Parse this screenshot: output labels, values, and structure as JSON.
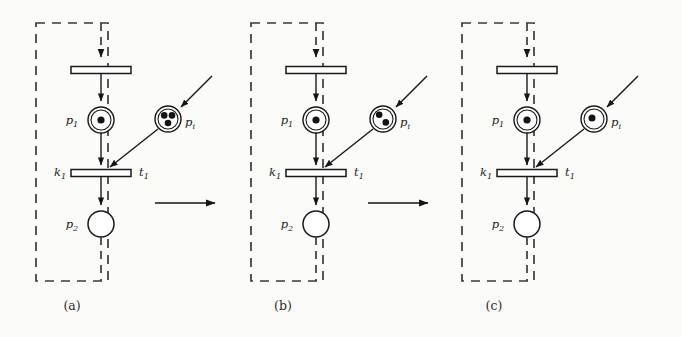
{
  "figure": {
    "panel_count": 3,
    "colors": {
      "ink": "#1c1c1c",
      "paper": "#fbfbfa",
      "dashed_border": "#3a3a3a",
      "token": "#141414",
      "place_fill": "#ffffff",
      "transition_fill": "#ffffff"
    },
    "panels": [
      {
        "id": "panel-a",
        "caption": "(a)",
        "dashed_box": {
          "x": 36,
          "y": 23,
          "w": 72,
          "h": 258
        },
        "places": [
          {
            "name": "p1",
            "label_base": "p",
            "label_sub": "1",
            "tokens": 1,
            "double_ring": true,
            "cx": 101,
            "cy": 120,
            "r": 13
          },
          {
            "name": "pi",
            "label_base": "p",
            "label_sub": "i",
            "tokens": 3,
            "double_ring": true,
            "cx": 168,
            "cy": 119,
            "r": 13
          },
          {
            "name": "p2",
            "label_base": "p",
            "label_sub": "2",
            "tokens": 0,
            "double_ring": false,
            "cx": 101,
            "cy": 224,
            "r": 13
          }
        ],
        "transitions": [
          {
            "name": "t-top",
            "label_left": "",
            "label_right": "",
            "cx": 101,
            "cy": 70,
            "w": 60,
            "h": 7
          },
          {
            "name": "t1",
            "label_left_base": "k",
            "label_left_sub": "1",
            "label_right_base": "t",
            "label_right_sub": "1",
            "cx": 101,
            "cy": 173,
            "w": 60,
            "h": 7
          }
        ],
        "flow_arrow": {
          "x1": 155,
          "y1": 203,
          "x2": 222,
          "y2": 203
        }
      },
      {
        "id": "panel-b",
        "caption": "(b)",
        "dashed_box": {
          "x": 251,
          "y": 23,
          "w": 72,
          "h": 258
        },
        "places": [
          {
            "name": "p1",
            "label_base": "p",
            "label_sub": "1",
            "tokens": 1,
            "double_ring": true,
            "cx": 316,
            "cy": 120,
            "r": 13
          },
          {
            "name": "pi",
            "label_base": "p",
            "label_sub": "i",
            "tokens": 2,
            "double_ring": true,
            "cx": 383,
            "cy": 119,
            "r": 13
          },
          {
            "name": "p2",
            "label_base": "p",
            "label_sub": "2",
            "tokens": 0,
            "double_ring": false,
            "cx": 316,
            "cy": 224,
            "r": 13
          }
        ],
        "transitions": [
          {
            "name": "t-top",
            "label_left": "",
            "label_right": "",
            "cx": 316,
            "cy": 70,
            "w": 60,
            "h": 7
          },
          {
            "name": "t1",
            "label_left_base": "k",
            "label_left_sub": "1",
            "label_right_base": "t",
            "label_right_sub": "1",
            "cx": 316,
            "cy": 173,
            "w": 60,
            "h": 7
          }
        ],
        "flow_arrow": {
          "x1": 368,
          "y1": 203,
          "x2": 435,
          "y2": 203
        }
      },
      {
        "id": "panel-c",
        "caption": "(c)",
        "dashed_box": {
          "x": 462,
          "y": 23,
          "w": 72,
          "h": 258
        },
        "places": [
          {
            "name": "p1",
            "label_base": "p",
            "label_sub": "1",
            "tokens": 1,
            "double_ring": true,
            "cx": 527,
            "cy": 120,
            "r": 13
          },
          {
            "name": "pi",
            "label_base": "p",
            "label_sub": "i",
            "tokens": 1,
            "double_ring": true,
            "cx": 594,
            "cy": 119,
            "r": 13
          },
          {
            "name": "p2",
            "label_base": "p",
            "label_sub": "2",
            "tokens": 0,
            "double_ring": false,
            "cx": 527,
            "cy": 224,
            "r": 13
          }
        ],
        "transitions": [
          {
            "name": "t-top",
            "label_left": "",
            "label_right": "",
            "cx": 527,
            "cy": 70,
            "w": 60,
            "h": 7
          },
          {
            "name": "t1",
            "label_left_base": "k",
            "label_left_sub": "1",
            "label_right_base": "t",
            "label_right_sub": "1",
            "cx": 527,
            "cy": 173,
            "w": 60,
            "h": 7
          }
        ],
        "flow_arrow": null
      }
    ],
    "labels": {
      "p1_base": "p",
      "p1_sub": "1",
      "p2_base": "p",
      "p2_sub": "2",
      "pi_base": "p",
      "pi_sub": "i",
      "t1_base": "t",
      "t1_sub": "1",
      "k1_base": "k",
      "k1_sub": "1",
      "caption_a": "(a)",
      "caption_b": "(b)",
      "caption_c": "(c)"
    }
  }
}
